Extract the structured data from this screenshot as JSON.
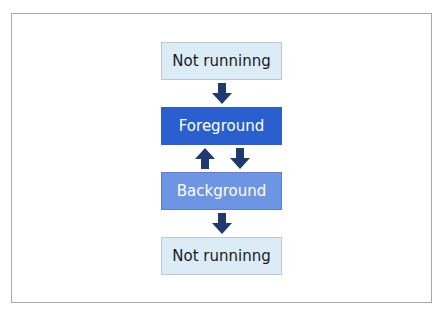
{
  "diagram": {
    "states": [
      {
        "id": "not-running-top",
        "label": "Not runninng"
      },
      {
        "id": "foreground",
        "label": "Foreground"
      },
      {
        "id": "background",
        "label": "Background"
      },
      {
        "id": "not-running-bottom",
        "label": "Not runninng"
      }
    ],
    "transitions": [
      {
        "from": "not-running-top",
        "to": "foreground"
      },
      {
        "from": "background",
        "to": "foreground"
      },
      {
        "from": "foreground",
        "to": "background"
      },
      {
        "from": "background",
        "to": "not-running-bottom"
      }
    ],
    "colors": {
      "light_box": "#dbecf7",
      "foreground_box": "#2a5fd0",
      "background_box": "#6e95e4",
      "arrow": "#1f3a6e"
    }
  }
}
